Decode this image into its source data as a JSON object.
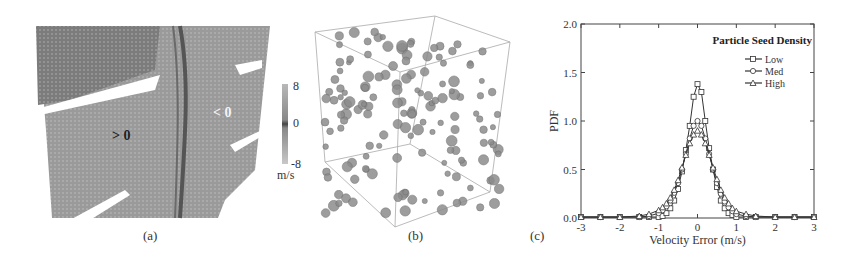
{
  "figure": {
    "panels": [
      {
        "id": "a",
        "caption": "(a)",
        "labels": {
          "positive": "> 0",
          "negative": "< 0"
        },
        "colorbar": {
          "ticks": [
            "8",
            "0",
            "-8"
          ],
          "unit": "m/s",
          "range": [
            -8,
            8
          ]
        }
      },
      {
        "id": "b",
        "caption": "(b)",
        "description": "3D box of seeded particles (spheres)"
      },
      {
        "id": "c",
        "caption": "(c)"
      }
    ]
  },
  "chart_data": {
    "type": "line",
    "title": "",
    "xlabel": "Velocity Error (m/s)",
    "ylabel": "PDF",
    "xlim": [
      -3,
      3
    ],
    "ylim": [
      0,
      2.0
    ],
    "xticks": [
      "-3",
      "-2",
      "-1",
      "0",
      "1",
      "2",
      "3"
    ],
    "yticks": [
      "0.0",
      "0.5",
      "1.0",
      "1.5",
      "2.0"
    ],
    "grid": false,
    "legend": {
      "title": "Particle Seed Density",
      "position": "upper right",
      "entries": [
        "Low",
        "Med",
        "High"
      ]
    },
    "x": [
      -3.0,
      -2.5,
      -2.0,
      -1.5,
      -1.25,
      -1.0,
      -0.9,
      -0.8,
      -0.7,
      -0.6,
      -0.5,
      -0.4,
      -0.3,
      -0.2,
      -0.1,
      0.0,
      0.1,
      0.2,
      0.3,
      0.4,
      0.5,
      0.6,
      0.7,
      0.8,
      0.9,
      1.0,
      1.25,
      1.5,
      2.0,
      2.5,
      3.0
    ],
    "series": [
      {
        "name": "Low",
        "marker": "square",
        "values": [
          0.01,
          0.01,
          0.01,
          0.01,
          0.01,
          0.01,
          0.02,
          0.05,
          0.1,
          0.18,
          0.3,
          0.48,
          0.7,
          0.95,
          1.25,
          1.38,
          1.3,
          1.0,
          0.72,
          0.5,
          0.32,
          0.18,
          0.1,
          0.05,
          0.03,
          0.01,
          0.01,
          0.01,
          0.01,
          0.01,
          0.01
        ]
      },
      {
        "name": "Med",
        "marker": "circle",
        "values": [
          0.01,
          0.01,
          0.01,
          0.01,
          0.02,
          0.05,
          0.08,
          0.12,
          0.18,
          0.26,
          0.36,
          0.5,
          0.66,
          0.82,
          0.95,
          1.0,
          0.95,
          0.82,
          0.66,
          0.5,
          0.36,
          0.25,
          0.17,
          0.11,
          0.07,
          0.04,
          0.02,
          0.01,
          0.01,
          0.01,
          0.01
        ]
      },
      {
        "name": "High",
        "marker": "triangle",
        "values": [
          0.01,
          0.01,
          0.01,
          0.02,
          0.04,
          0.08,
          0.11,
          0.15,
          0.21,
          0.29,
          0.39,
          0.52,
          0.65,
          0.77,
          0.86,
          0.9,
          0.86,
          0.77,
          0.65,
          0.52,
          0.4,
          0.29,
          0.21,
          0.15,
          0.1,
          0.07,
          0.04,
          0.02,
          0.01,
          0.01,
          0.01
        ]
      }
    ]
  }
}
